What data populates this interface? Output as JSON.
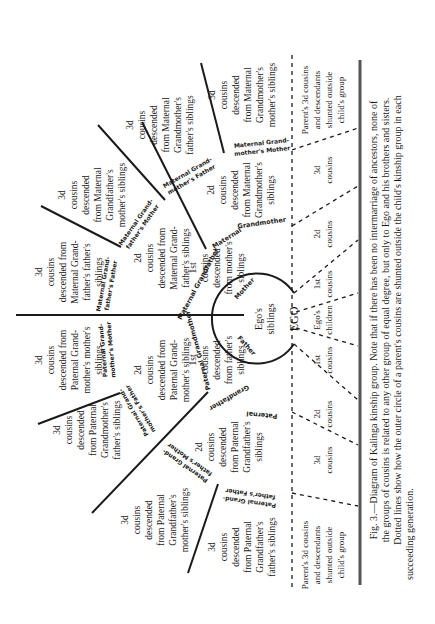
{
  "figure": {
    "label": "Fig. 3.",
    "caption_lines": [
      "Fig. 3.—Diagram of Kalinga kinship group. Note that if there has been no intermarriage of ancestors, none of",
      "the groups of cousins is related to any other group of equal degree, but only to Ego and his brothers and sisters.",
      "Dotted lines show how the outer circle of a parent's cousins are shunted outside the child's kinship group in each",
      "succeeding generation."
    ]
  },
  "center": {
    "ego": "EGO",
    "siblings": [
      "Ego's",
      "siblings"
    ],
    "father": "Father",
    "mother": "Mother"
  },
  "ancestor_labels": {
    "maternal_grandfather": "Maternal Grandfather",
    "maternal_grandmother": [
      "Maternal",
      "Grandmother"
    ],
    "paternal_grandmother": "Paternal Grandmother",
    "paternal_grandfather": [
      "Paternal",
      "Grandfather"
    ],
    "maternal_grandfathers_father": [
      "Maternal Grand-",
      "father's Father"
    ],
    "maternal_grandfathers_mother": [
      "Maternal Grand-",
      "father's Mother"
    ],
    "maternal_grandmothers_father": [
      "Maternal Grand-",
      "mother's Father"
    ],
    "maternal_grandmothers_mother": [
      "Maternal Grand-",
      "mother's Mother"
    ],
    "paternal_grandmothers_mother": [
      "Paternal Grand-",
      "mother's Mother"
    ],
    "paternal_grandmothers_father": [
      "Paternal Grand-",
      "mother's Father"
    ],
    "paternal_grandfathers_mother": [
      "Paternal Grand-",
      "father's Mother"
    ],
    "paternal_grandfathers_father": [
      "Paternal Grand-",
      "father's Father"
    ]
  },
  "first_cousins": {
    "maternal": [
      "1st",
      "cousins",
      "descended",
      "from mother's",
      "siblings"
    ],
    "paternal": [
      "1st",
      "cousins",
      "descended",
      "from father's",
      "siblings"
    ]
  },
  "second_cousins": {
    "mat_gf": [
      "2d",
      "cousins",
      "descended from",
      "Maternal Grand-",
      "father's siblings"
    ],
    "mat_gm": [
      "2d",
      "cousins",
      "descended",
      "from Maternal",
      "Grandmother's",
      "siblings"
    ],
    "pat_gm": [
      "2d",
      "cousins",
      "descended from",
      "Paternal Grand-",
      "mother's siblings"
    ],
    "pat_gf": [
      "2d",
      "cousins",
      "descended",
      "from Paternal",
      "Grandfather's",
      "siblings"
    ]
  },
  "third_cousins": {
    "mat_gm_mother": [
      "3d",
      "cousins",
      "descended",
      "from Maternal",
      "Grandmother's",
      "mother's siblings"
    ],
    "mat_gm_father": [
      "3d",
      "cousins",
      "descended",
      "from Maternal",
      "Grandmother's",
      "father's siblings"
    ],
    "mat_gf_mother": [
      "3d",
      "cousins",
      "descended",
      "from Maternal",
      "Grandfather's",
      "mother's siblings"
    ],
    "mat_gf_father": [
      "3d",
      "cousins",
      "descended from",
      "Maternal Grand-",
      "father's father's",
      "siblings"
    ],
    "pat_gm_mother": [
      "3d",
      "cousins",
      "descended from",
      "Paternal Grand-",
      "mother's mother's",
      "siblings"
    ],
    "pat_gm_father": [
      "3d",
      "cousins",
      "descended",
      "from Paternal",
      "Grandmother's",
      "father's siblings"
    ],
    "pat_gf_mother": [
      "3d",
      "cousins",
      "descended",
      "from Paternal",
      "Grandfather's",
      "mother's siblings"
    ],
    "pat_gf_father": [
      "3d",
      "cousins",
      "descended",
      "from Paternal",
      "Grandfather's",
      "father's siblings"
    ]
  },
  "next_generation": {
    "egos_children": [
      "Ego's",
      "children"
    ],
    "first_cousins": [
      "1st",
      "cousins"
    ],
    "second_cousins": [
      "2d",
      "cousins"
    ],
    "third_cousins": [
      "3d",
      "cousins"
    ],
    "shunted": [
      "Parent's 3d cousins",
      "and descendants",
      "shunted outside",
      "child's group"
    ]
  }
}
